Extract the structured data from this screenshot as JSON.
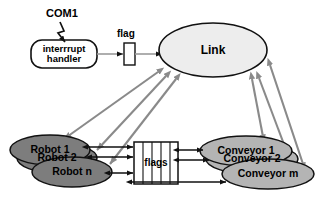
{
  "diagram": {
    "colors": {
      "background": "#ffffff",
      "link_fill": "#eeeeee",
      "robot_fill": "#7d7d7d",
      "conveyor_fill": "#b4b4b4",
      "box_fill": "#ffffff",
      "stroke_black": "#111111",
      "arrow_gray": "#808080"
    },
    "nodes": {
      "com1": {
        "label": "COM1",
        "shape": "text"
      },
      "interrupt_handler": {
        "label": "interrrupt\nhandler",
        "shape": "rounded-rect"
      },
      "flag": {
        "label": "flag",
        "shape": "rect"
      },
      "link": {
        "label": "Link",
        "shape": "ellipse"
      },
      "flags": {
        "label": "flags",
        "shape": "segmented-rect",
        "cells": 5
      },
      "robots": [
        {
          "label": "Robot 1"
        },
        {
          "label": "Robot 2"
        },
        {
          "label": "Robot n"
        }
      ],
      "conveyors": [
        {
          "label": "Conveyor 1"
        },
        {
          "label": "Conveyor 2"
        },
        {
          "label": "Conveyor m"
        }
      ]
    }
  }
}
